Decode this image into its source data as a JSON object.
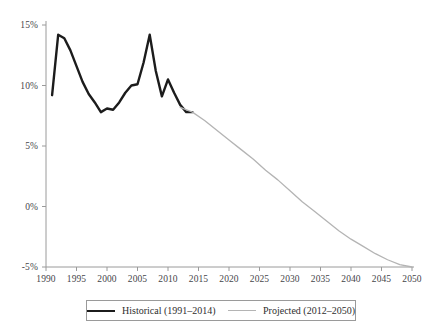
{
  "chart_data": {
    "type": "line",
    "title": "",
    "subtitle": "",
    "xlabel": "",
    "ylabel": "",
    "xlim": [
      1990,
      2050
    ],
    "ylim": [
      -5,
      15
    ],
    "grid": false,
    "legend_position": "bottom-center",
    "y_tick_labels": [
      "15%",
      "10%",
      "5%",
      "0%",
      "-5%"
    ],
    "y_tick_values": [
      15,
      10,
      5,
      0,
      -5
    ],
    "x_tick_labels": [
      "1990",
      "1995",
      "2000",
      "2005",
      "2010",
      "2015",
      "2020",
      "2025",
      "2030",
      "2035",
      "2040",
      "2045",
      "2050"
    ],
    "x_tick_values": [
      1990,
      1995,
      2000,
      2005,
      2010,
      2015,
      2020,
      2025,
      2030,
      2035,
      2040,
      2045,
      2050
    ],
    "series": [
      {
        "name": "Historical (1991–2014)",
        "color": "#1c1c1c",
        "width": 2.4,
        "x": [
          1991,
          1992,
          1993,
          1994,
          1995,
          1996,
          1997,
          1998,
          1999,
          2000,
          2001,
          2002,
          2003,
          2004,
          2005,
          2006,
          2007,
          2008,
          2009,
          2010,
          2011,
          2012,
          2013,
          2014
        ],
        "values": [
          9.2,
          14.2,
          13.9,
          12.9,
          11.6,
          10.3,
          9.3,
          8.6,
          7.8,
          8.1,
          8.0,
          8.6,
          9.4,
          10.0,
          10.1,
          11.9,
          14.2,
          11.2,
          9.1,
          10.5,
          9.4,
          8.4,
          7.8,
          7.8
        ]
      },
      {
        "name": "Projected (2012–2050)",
        "color": "#b4b4b4",
        "width": 1.3,
        "x": [
          2012,
          2014,
          2016,
          2018,
          2020,
          2022,
          2024,
          2026,
          2028,
          2030,
          2032,
          2034,
          2036,
          2038,
          2040,
          2042,
          2044,
          2046,
          2048,
          2050
        ],
        "values": [
          8.2,
          7.8,
          7.1,
          6.3,
          5.5,
          4.7,
          3.9,
          3.0,
          2.2,
          1.3,
          0.4,
          -0.4,
          -1.2,
          -2.0,
          -2.7,
          -3.3,
          -3.9,
          -4.4,
          -4.8,
          -5.0
        ]
      }
    ],
    "legend": [
      {
        "label": "Historical (1991–2014)",
        "style": "historical"
      },
      {
        "label": "Projected (2012–2050)",
        "style": "projected"
      }
    ],
    "axis_color": "#9a9a9a",
    "text_color": "#46464a"
  }
}
